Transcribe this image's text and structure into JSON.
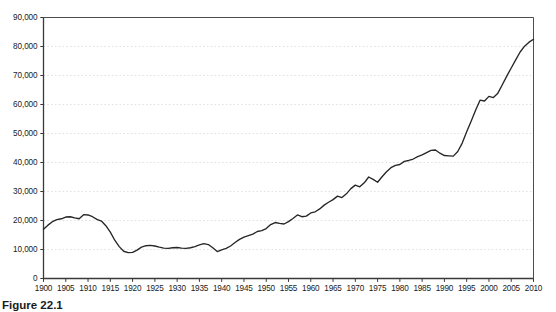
{
  "caption": "Figure 22.1",
  "colors": {
    "line": "#262626",
    "axis": "#4d4d4d",
    "grid": "#d9d9d9",
    "text": "#1a1a1a",
    "background": "#ffffff"
  },
  "chart_data": {
    "type": "line",
    "title": "",
    "xlabel": "",
    "ylabel": "",
    "xlim": [
      1900,
      2010
    ],
    "ylim": [
      0,
      90000
    ],
    "grid": true,
    "legend": false,
    "ytick_labels": [
      "90,000",
      "80,000",
      "70,000",
      "60,000",
      "50,000",
      "40,000",
      "30,000",
      "20,000",
      "10,000",
      "0"
    ],
    "ytick_values": [
      90000,
      80000,
      70000,
      60000,
      50000,
      40000,
      30000,
      20000,
      10000,
      0
    ],
    "xtick_labels": [
      "1900",
      "1905",
      "1910",
      "1915",
      "1920",
      "1925",
      "1930",
      "1935",
      "1940",
      "1945",
      "1950",
      "1955",
      "1960",
      "1965",
      "1970",
      "1975",
      "1980",
      "1985",
      "1990",
      "1995",
      "2000",
      "2005",
      "2010"
    ],
    "xtick_values": [
      1900,
      1905,
      1910,
      1915,
      1920,
      1925,
      1930,
      1935,
      1940,
      1945,
      1950,
      1955,
      1960,
      1965,
      1970,
      1975,
      1980,
      1985,
      1990,
      1995,
      2000,
      2005,
      2010
    ],
    "x": [
      1900,
      1901,
      1902,
      1903,
      1904,
      1905,
      1906,
      1907,
      1908,
      1909,
      1910,
      1911,
      1912,
      1913,
      1914,
      1915,
      1916,
      1917,
      1918,
      1919,
      1920,
      1921,
      1922,
      1923,
      1924,
      1925,
      1926,
      1927,
      1928,
      1929,
      1930,
      1931,
      1932,
      1933,
      1934,
      1935,
      1936,
      1937,
      1938,
      1939,
      1940,
      1941,
      1942,
      1943,
      1944,
      1945,
      1946,
      1947,
      1948,
      1949,
      1950,
      1951,
      1952,
      1953,
      1954,
      1955,
      1956,
      1957,
      1958,
      1959,
      1960,
      1961,
      1962,
      1963,
      1964,
      1965,
      1966,
      1967,
      1968,
      1969,
      1970,
      1971,
      1972,
      1973,
      1974,
      1975,
      1976,
      1977,
      1978,
      1979,
      1980,
      1981,
      1982,
      1983,
      1984,
      1985,
      1986,
      1987,
      1988,
      1989,
      1990,
      1991,
      1992,
      1993,
      1994,
      1995,
      1996,
      1997,
      1998,
      1999,
      2000,
      2001,
      2002,
      2003,
      2004,
      2005,
      2006,
      2007,
      2008,
      2009,
      2010
    ],
    "values": [
      17000,
      18400,
      19600,
      20300,
      20600,
      21200,
      21300,
      20900,
      20600,
      22000,
      21900,
      21300,
      20400,
      19800,
      18200,
      16000,
      13200,
      11000,
      9400,
      8900,
      9000,
      9800,
      10800,
      11300,
      11400,
      11200,
      10800,
      10500,
      10400,
      10600,
      10700,
      10500,
      10400,
      10600,
      11000,
      11600,
      12000,
      11700,
      10600,
      9300,
      9900,
      10400,
      11200,
      12400,
      13500,
      14300,
      14800,
      15300,
      16200,
      16500,
      17200,
      18600,
      19300,
      19000,
      18800,
      19600,
      20700,
      21900,
      21300,
      21500,
      22600,
      23000,
      24000,
      25300,
      26300,
      27200,
      28400,
      27900,
      29200,
      31000,
      32200,
      31600,
      33000,
      35000,
      34200,
      33200,
      35100,
      36800,
      38200,
      39000,
      39300,
      40400,
      40700,
      41200,
      42000,
      42600,
      43400,
      44200,
      44300,
      43200,
      42400,
      42300,
      42200,
      43800,
      46700,
      50600,
      54200,
      58000,
      61500,
      61200,
      62800,
      62400,
      63900,
      66800,
      69800,
      72600,
      75400,
      78100,
      80100,
      81500,
      82500
    ]
  }
}
